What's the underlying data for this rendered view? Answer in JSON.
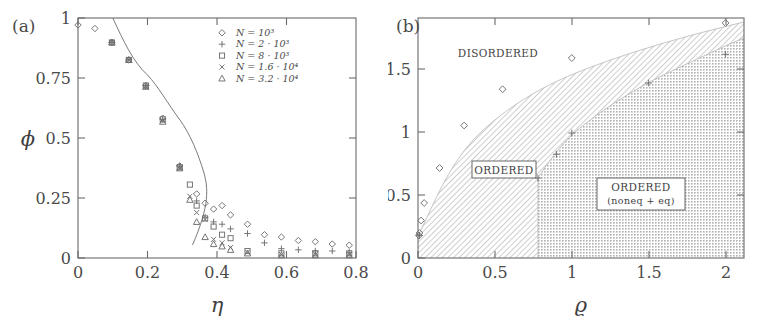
{
  "figure": {
    "panel_a_label": "(a)",
    "panel_b_label": "(b)"
  },
  "panel_a": {
    "xlabel": "η",
    "ylabel": "ϕ",
    "xticks": [
      "0",
      "0.2",
      "0.4",
      "0.6",
      "0.8"
    ],
    "yticks": [
      "0",
      "0.25",
      "0.5",
      "0.75",
      "1"
    ],
    "legend": [
      {
        "marker": "diamond",
        "label": "N = 10³"
      },
      {
        "marker": "plus",
        "label": "N = 2 · 10³"
      },
      {
        "marker": "square",
        "label": "N = 8 · 10³"
      },
      {
        "marker": "cross",
        "label": "N = 1.6 · 10⁴"
      },
      {
        "marker": "triangle",
        "label": "N = 3.2 · 10⁴"
      }
    ]
  },
  "panel_b": {
    "xlabel": "ϱ",
    "ylabel": "ηc",
    "xticks": [
      "0",
      "0.5",
      "1",
      "1.5",
      "2"
    ],
    "yticks": [
      "0",
      "0.5",
      "1",
      "1.5"
    ],
    "regions": {
      "disordered": "DISORDERED",
      "ordered": "ORDERED",
      "ordered_noneq_line1": "ORDERED",
      "ordered_noneq_line2": "(noneq + eq)"
    }
  },
  "chart_data": [
    {
      "type": "scatter",
      "panel": "a",
      "title": "",
      "xlabel": "η",
      "ylabel": "ϕ",
      "xlim": [
        0,
        0.82
      ],
      "ylim": [
        0,
        1.03
      ],
      "xticks": [
        0,
        0.2,
        0.4,
        0.6,
        0.8
      ],
      "yticks": [
        0,
        0.25,
        0.5,
        0.75,
        1
      ],
      "grid": false,
      "legend_position": "top-right",
      "series": [
        {
          "name": "N = 10³",
          "marker": "diamond",
          "x": [
            0.0,
            0.05,
            0.1,
            0.15,
            0.2,
            0.25,
            0.3,
            0.35,
            0.375,
            0.4,
            0.425,
            0.45,
            0.5,
            0.55,
            0.6,
            0.65,
            0.7,
            0.75,
            0.8
          ],
          "y": [
            1.0,
            0.985,
            0.925,
            0.85,
            0.74,
            0.6,
            0.395,
            0.275,
            0.235,
            0.21,
            0.225,
            0.185,
            0.145,
            0.1,
            0.09,
            0.075,
            0.07,
            0.06,
            0.055
          ]
        },
        {
          "name": "N = 2 · 10³",
          "marker": "plus",
          "x": [
            0.1,
            0.15,
            0.2,
            0.25,
            0.3,
            0.35,
            0.375,
            0.4,
            0.425,
            0.45,
            0.5,
            0.55,
            0.6,
            0.65,
            0.7,
            0.75,
            0.8
          ],
          "y": [
            0.925,
            0.85,
            0.74,
            0.595,
            0.395,
            0.245,
            0.175,
            0.155,
            0.145,
            0.125,
            0.105,
            0.065,
            0.04,
            0.035,
            0.03,
            0.03,
            0.025
          ]
        },
        {
          "name": "N = 8 · 10³",
          "marker": "square",
          "x": [
            0.1,
            0.15,
            0.2,
            0.25,
            0.3,
            0.33,
            0.35,
            0.375,
            0.4,
            0.425,
            0.45,
            0.5,
            0.6,
            0.7,
            0.8
          ],
          "y": [
            0.925,
            0.85,
            0.74,
            0.595,
            0.39,
            0.315,
            0.225,
            0.17,
            0.135,
            0.1,
            0.085,
            0.03,
            0.02,
            0.02,
            0.02
          ]
        },
        {
          "name": "N = 1.6 · 10⁴",
          "marker": "cross",
          "x": [
            0.1,
            0.15,
            0.2,
            0.25,
            0.3,
            0.33,
            0.35,
            0.375,
            0.4,
            0.425,
            0.45,
            0.5,
            0.6,
            0.7,
            0.8
          ],
          "y": [
            0.925,
            0.85,
            0.735,
            0.59,
            0.385,
            0.265,
            0.195,
            0.165,
            0.08,
            0.065,
            0.045,
            0.025,
            0.015,
            0.015,
            0.015
          ]
        },
        {
          "name": "N = 3.2 · 10⁴",
          "marker": "triangle",
          "x": [
            0.1,
            0.15,
            0.2,
            0.25,
            0.3,
            0.33,
            0.35,
            0.375,
            0.4,
            0.425,
            0.45,
            0.5,
            0.6,
            0.7,
            0.8
          ],
          "y": [
            0.925,
            0.85,
            0.735,
            0.585,
            0.385,
            0.25,
            0.155,
            0.09,
            0.06,
            0.05,
            0.035,
            0.02,
            0.012,
            0.012,
            0.012
          ]
        },
        {
          "name": "fit-curve",
          "marker": "line",
          "x": [
            0.1,
            0.15,
            0.2,
            0.25,
            0.28,
            0.3,
            0.32,
            0.33,
            0.335,
            0.338,
            0.34
          ],
          "y": [
            1.0,
            0.885,
            0.75,
            0.585,
            0.48,
            0.4,
            0.3,
            0.22,
            0.16,
            0.11,
            0.055
          ]
        }
      ]
    },
    {
      "type": "line",
      "panel": "b",
      "title": "",
      "xlabel": "ϱ",
      "ylabel": "ηc",
      "xlim": [
        0,
        2.12
      ],
      "ylim": [
        0,
        1.92
      ],
      "xticks": [
        0,
        0.5,
        1,
        1.5,
        2
      ],
      "yticks": [
        0,
        0.5,
        1,
        1.5
      ],
      "grid": false,
      "legend_position": "none",
      "series": [
        {
          "name": "order-disorder boundary (diamonds)",
          "marker": "diamond",
          "x": [
            0.005,
            0.01,
            0.02,
            0.04,
            0.14,
            0.3,
            0.55,
            1.0,
            2.0
          ],
          "y": [
            0.18,
            0.2,
            0.3,
            0.44,
            0.72,
            1.06,
            1.35,
            1.6,
            1.88
          ]
        },
        {
          "name": "noneq-eq boundary (pluses)",
          "marker": "plus",
          "x": [
            0.01,
            0.78,
            0.9,
            1.0,
            1.5,
            2.0
          ],
          "y": [
            0.18,
            0.64,
            0.83,
            1.0,
            1.4,
            1.63
          ]
        }
      ]
    }
  ]
}
